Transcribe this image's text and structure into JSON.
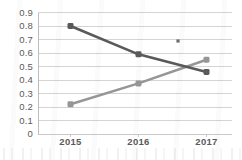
{
  "chart_data": {
    "type": "line",
    "title": "",
    "subtitle": "",
    "xlabel": "",
    "ylabel": "",
    "categories": [
      "2015",
      "2016",
      "2017"
    ],
    "ylim": [
      0,
      0.9
    ],
    "yticks": [
      "0.9",
      "0.8",
      "0.7",
      "0.6",
      "0.5",
      "0.4",
      "0.3",
      "0.2",
      "0.1",
      "0"
    ],
    "ytick_values": [
      0.9,
      0.8,
      0.7,
      0.6,
      0.5,
      0.4,
      0.3,
      0.2,
      0.1,
      0
    ],
    "grid": "horizontal",
    "legend": "none",
    "series": [
      {
        "name": "declining-series",
        "values": [
          0.8,
          0.59,
          0.46
        ],
        "color": "#595959",
        "marker": "square"
      },
      {
        "name": "rising-series",
        "values": [
          0.22,
          0.375,
          0.55
        ],
        "color": "#969696",
        "marker": "square"
      }
    ],
    "annotations": [
      {
        "name": "stray-dot-artifact",
        "x_px": 178,
        "y_px": 41,
        "color": "#6e6e6e"
      }
    ],
    "colors": {
      "background": "#ffffff",
      "gridline": "#d4d4d4",
      "axis": "#bdbdbd",
      "tick_text": "#5a5a5a",
      "series_dark": "#595959",
      "series_light": "#969696"
    }
  }
}
